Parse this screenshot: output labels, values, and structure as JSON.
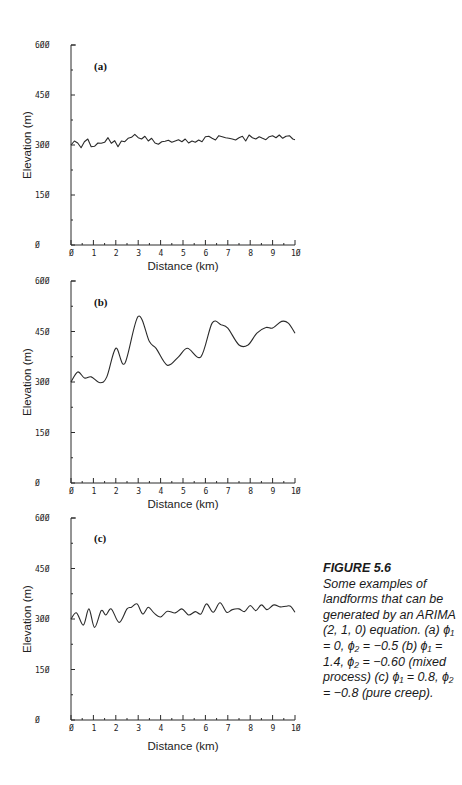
{
  "figure": {
    "number": "FIGURE 5.6",
    "caption": "Some examples of landforms that can be generated by an ARIMA (2, 1, 0) equation. (a) ϕ₁ = 0, ϕ₂ = −0.5 (b) ϕ₁ = 1.4, ϕ₂ = −0.60 (mixed process) (c) ϕ₁ = 0.8, ϕ₂ = −0.8 (pure creep)."
  },
  "chart_data": [
    {
      "type": "line",
      "panel": "(a)",
      "title": "",
      "xlabel": "Distance (km)",
      "ylabel": "Elevation (m)",
      "xlim": [
        0,
        10
      ],
      "ylim": [
        0,
        600
      ],
      "xticks": [
        "0",
        "1",
        "2",
        "3",
        "4",
        "5",
        "6",
        "7",
        "8",
        "9",
        "10"
      ],
      "yticks": [
        "0",
        "150",
        "300",
        "450",
        "600"
      ],
      "grid": false,
      "series": [
        {
          "name": "a",
          "x": [
            0,
            0.15,
            0.3,
            0.45,
            0.6,
            0.75,
            0.9,
            1.05,
            1.2,
            1.35,
            1.5,
            1.65,
            1.8,
            1.95,
            2.1,
            2.25,
            2.4,
            2.55,
            2.7,
            2.85,
            3.0,
            3.15,
            3.3,
            3.45,
            3.6,
            3.75,
            3.9,
            4.05,
            4.2,
            4.35,
            4.5,
            4.65,
            4.8,
            4.95,
            5.1,
            5.25,
            5.4,
            5.55,
            5.7,
            5.85,
            6.0,
            6.15,
            6.3,
            6.45,
            6.6,
            6.75,
            6.9,
            7.05,
            7.2,
            7.35,
            7.5,
            7.65,
            7.8,
            7.95,
            8.1,
            8.25,
            8.4,
            8.55,
            8.7,
            8.85,
            9.0,
            9.15,
            9.3,
            9.45,
            9.6,
            9.75,
            9.9,
            10
          ],
          "values": [
            300,
            312,
            306,
            292,
            310,
            318,
            295,
            296,
            306,
            305,
            308,
            322,
            305,
            313,
            295,
            312,
            310,
            320,
            323,
            332,
            322,
            318,
            326,
            312,
            320,
            306,
            302,
            310,
            311,
            314,
            308,
            312,
            316,
            310,
            318,
            306,
            312,
            308,
            315,
            310,
            325,
            326,
            320,
            315,
            328,
            325,
            322,
            320,
            318,
            315,
            322,
            326,
            312,
            330,
            322,
            318,
            325,
            320,
            316,
            325,
            328,
            322,
            330,
            320,
            326,
            328,
            318,
            316
          ]
        }
      ]
    },
    {
      "type": "line",
      "panel": "(b)",
      "title": "",
      "xlabel": "Distance (km)",
      "ylabel": "Elevation (m)",
      "xlim": [
        0,
        10
      ],
      "ylim": [
        0,
        600
      ],
      "xticks": [
        "0",
        "1",
        "2",
        "3",
        "4",
        "5",
        "6",
        "7",
        "8",
        "9",
        "10"
      ],
      "yticks": [
        "0",
        "150",
        "300",
        "450",
        "600"
      ],
      "grid": false,
      "series": [
        {
          "name": "b",
          "x": [
            0,
            0.3,
            0.6,
            0.9,
            1.3,
            1.6,
            2.0,
            2.4,
            3.0,
            3.5,
            3.8,
            4.3,
            4.8,
            5.2,
            5.8,
            6.3,
            6.7,
            7.0,
            7.5,
            7.9,
            8.3,
            8.7,
            9.0,
            9.4,
            9.7,
            10
          ],
          "values": [
            300,
            330,
            312,
            315,
            298,
            315,
            400,
            355,
            495,
            420,
            400,
            350,
            375,
            400,
            375,
            475,
            470,
            460,
            410,
            410,
            445,
            462,
            460,
            480,
            475,
            445
          ]
        }
      ]
    },
    {
      "type": "line",
      "panel": "(c)",
      "title": "",
      "xlabel": "Distance (km)",
      "ylabel": "Elevation (m)",
      "xlim": [
        0,
        10
      ],
      "ylim": [
        0,
        600
      ],
      "xticks": [
        "0",
        "1",
        "2",
        "3",
        "4",
        "5",
        "6",
        "7",
        "8",
        "9",
        "10"
      ],
      "yticks": [
        "0",
        "150",
        "300",
        "450",
        "600"
      ],
      "grid": false,
      "series": [
        {
          "name": "c",
          "x": [
            0,
            0.25,
            0.55,
            0.8,
            1.05,
            1.35,
            1.55,
            1.8,
            2.15,
            2.5,
            2.7,
            2.95,
            3.2,
            3.45,
            3.7,
            4.0,
            4.3,
            4.65,
            4.95,
            5.25,
            5.55,
            5.8,
            6.05,
            6.35,
            6.65,
            6.95,
            7.2,
            7.5,
            7.75,
            8.0,
            8.25,
            8.5,
            8.75,
            9.05,
            9.35,
            9.6,
            9.8,
            10
          ],
          "values": [
            300,
            318,
            282,
            330,
            275,
            325,
            312,
            330,
            290,
            330,
            335,
            345,
            315,
            335,
            318,
            306,
            323,
            318,
            330,
            312,
            322,
            315,
            345,
            320,
            348,
            320,
            328,
            330,
            322,
            340,
            325,
            342,
            328,
            342,
            336,
            338,
            338,
            320
          ]
        }
      ]
    }
  ],
  "panels": [
    {
      "label": "(a)",
      "geom": {
        "x0": 71,
        "x1": 295,
        "ytop": 45,
        "ybot": 245,
        "labelX": 94,
        "labelY": 70
      },
      "axis": {
        "ylabel": "Elevation (m)",
        "xlabel": "Distance (km)"
      }
    },
    {
      "label": "(b)",
      "geom": {
        "x0": 71,
        "x1": 295,
        "ytop": 281,
        "ybot": 483,
        "labelX": 94,
        "labelY": 306
      },
      "axis": {
        "ylabel": "Elevation (m)",
        "xlabel": "Distance (km)"
      }
    },
    {
      "label": "(c)",
      "geom": {
        "x0": 71,
        "x1": 295,
        "ytop": 518,
        "ybot": 720,
        "labelX": 94,
        "labelY": 542
      },
      "axis": {
        "ylabel": "Elevation (m)",
        "xlabel": "Distance (km)"
      }
    }
  ],
  "style": {
    "line_color": "#2a2a2a",
    "axis_color": "#2a2a2a",
    "background": "#ffffff"
  }
}
